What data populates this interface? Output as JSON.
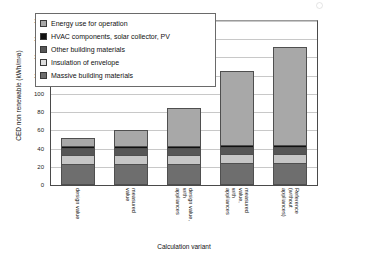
{
  "chart_data": {
    "type": "bar",
    "stacked": true,
    "title": "",
    "xlabel": "Calculation variant",
    "ylabel": "CED non renewable (kWh/m²a)",
    "ylim": [
      0,
      180
    ],
    "yticks": [
      0,
      20,
      40,
      60,
      80,
      100,
      120,
      140,
      160,
      180
    ],
    "ytick_labels": [
      "0",
      "20",
      "40",
      "60",
      "80",
      "100",
      "120",
      "140",
      "160",
      "180"
    ],
    "grid": true,
    "grid_axis": "y",
    "legend_position": "upper-left",
    "categories": [
      "design value",
      "measured value",
      "design value, with\nappliances",
      "measured value,\nwith appliances",
      "Reference (without\nappliances)"
    ],
    "series": [
      {
        "name": "Massive building materials",
        "color": "#6e6e6e",
        "values": [
          22,
          22,
          22,
          22,
          22
        ]
      },
      {
        "name": "Insulation of envelope",
        "color": "#c6c6c6",
        "values": [
          10,
          10,
          10,
          10,
          10
        ]
      },
      {
        "name": "Other building materials",
        "color": "#565656",
        "values": [
          8,
          8,
          8,
          8,
          8
        ]
      },
      {
        "name": "HVAC components, solar collector, PV",
        "color": "#111111",
        "values": [
          2,
          2,
          2,
          2,
          2
        ]
      },
      {
        "name": "Energy use for operation",
        "color": "#a8a8a8",
        "values": [
          10,
          18,
          42,
          83,
          110
        ]
      }
    ],
    "totals": [
      52,
      60,
      84,
      125,
      152
    ]
  },
  "axes": {
    "y_title": "CED non renewable (kWh/m²a)",
    "x_title": "Calculation variant"
  },
  "legend": {
    "items": [
      {
        "label": "Energy use for operation",
        "color": "#a8a8a8"
      },
      {
        "label": "HVAC components, solar collector, PV",
        "color": "#111111"
      },
      {
        "label": "Other building materials",
        "color": "#565656"
      },
      {
        "label": "Insulation of envelope",
        "color": "#dedede"
      },
      {
        "label": "Massive building materials",
        "color": "#6e6e6e"
      }
    ]
  }
}
